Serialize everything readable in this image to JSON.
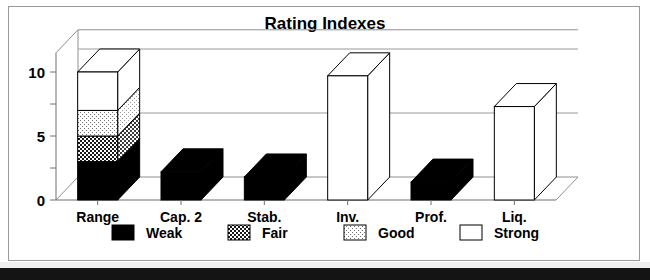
{
  "figure": {
    "title": "Rating Indexes",
    "frame_color": "#9a9a9a",
    "background": "#ffffff"
  },
  "chart_data": {
    "type": "bar",
    "title": "Rating Indexes",
    "subtitle": "",
    "xlabel": "",
    "ylabel": "",
    "categories": [
      "Range",
      "Cap. 2",
      "Stab.",
      "Inv.",
      "Prof.",
      "Liq."
    ],
    "ylim": [
      0,
      11.5
    ],
    "yticks": [
      0,
      5,
      10
    ],
    "ytick_labels": [
      "0",
      "5",
      "10"
    ],
    "minor_yticks": [
      2.5,
      7.5
    ],
    "grid": true,
    "legend_position": "bottom",
    "style": "3d-perspective-bars",
    "series": [
      {
        "name": "Weak",
        "key": "weak",
        "fill": "#000000",
        "pattern": "solid-black",
        "values": [
          3.0,
          2.2,
          1.8,
          0,
          1.4,
          0
        ]
      },
      {
        "name": "Fair",
        "key": "fair",
        "fill": "#3a3a3a",
        "pattern": "dense-checker",
        "values": [
          2.0,
          0,
          0,
          0,
          0,
          0
        ]
      },
      {
        "name": "Good",
        "key": "good",
        "fill": "#d0d0d0",
        "pattern": "light-dots",
        "values": [
          2.0,
          0,
          0,
          0,
          0,
          0
        ]
      },
      {
        "name": "Strong",
        "key": "strong",
        "fill": "#ffffff",
        "pattern": "white",
        "values": [
          3.0,
          0,
          0,
          9.7,
          0,
          7.3
        ]
      }
    ],
    "bar_totals": [
      10.0,
      2.2,
      1.8,
      9.7,
      1.4,
      7.3
    ]
  },
  "legend": {
    "items": [
      {
        "label": "Weak",
        "swatch": "solid-black"
      },
      {
        "label": "Fair",
        "swatch": "dense-checker"
      },
      {
        "label": "Good",
        "swatch": "light-dots"
      },
      {
        "label": "Strong",
        "swatch": "white"
      }
    ]
  },
  "axis": {
    "y_tick_labels": [
      "10",
      "5",
      "0"
    ],
    "x_tick_labels": [
      "Range",
      "Cap. 2",
      "Stab.",
      "Inv.",
      "Prof.",
      "Liq."
    ]
  }
}
